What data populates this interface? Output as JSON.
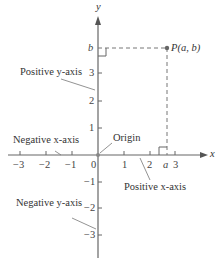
{
  "diagram": {
    "type": "cartesian-coordinate-plane",
    "axes": {
      "x_label": "x",
      "y_label": "y",
      "x_ticks": [
        "−3",
        "−2",
        "−1",
        "0",
        "1",
        "2",
        "3"
      ],
      "y_ticks_positive": [
        "1",
        "2",
        "3"
      ],
      "y_ticks_negative": [
        "−1",
        "−2",
        "−3"
      ],
      "x_marker": "a",
      "y_marker": "b"
    },
    "point": {
      "label": "P(a, b)"
    },
    "annotations": {
      "positive_y": "Positive y-axis",
      "negative_y": "Negative y-axis",
      "positive_x": "Positive x-axis",
      "negative_x": "Negative x-axis",
      "origin": "Origin"
    },
    "colors": {
      "axis": "#555555",
      "text": "#333333",
      "point": "#666666"
    }
  }
}
